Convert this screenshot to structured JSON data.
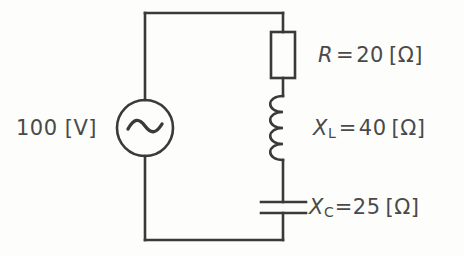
{
  "diagram": {
    "title_text": "",
    "type": "ac-series-rlc-circuit",
    "stroke_color": "#3a3a3a",
    "text_color": "#4a4a4a",
    "background_color": "#fdfdfc"
  },
  "source": {
    "icon_name": "ac-source-symbol",
    "value": "100",
    "unit": "[V]",
    "label_text": "100 [V]"
  },
  "components": {
    "resistor": {
      "icon_name": "resistor-symbol",
      "symbol": "R",
      "subscript": "",
      "equals": "=",
      "value": "20",
      "unit": "[Ω]"
    },
    "inductor": {
      "icon_name": "inductor-coil-symbol",
      "symbol": "X",
      "subscript": "L",
      "equals": "=",
      "value": "40",
      "unit": "[Ω]"
    },
    "capacitor": {
      "icon_name": "capacitor-symbol",
      "symbol": "X",
      "subscript": "C",
      "equals": "=",
      "value": "25",
      "unit": "[Ω]"
    }
  }
}
